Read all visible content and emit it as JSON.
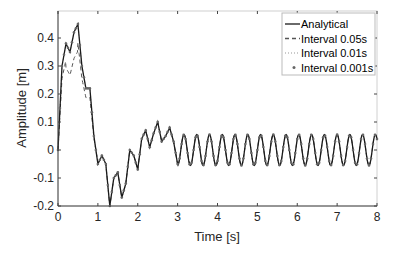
{
  "chart_data": {
    "type": "line",
    "title": "",
    "xlabel": "Time [s]",
    "ylabel": "Amplitude [m]",
    "xlim": [
      0,
      8
    ],
    "ylim": [
      -0.2,
      0.47
    ],
    "xticks": [
      "0",
      "1",
      "2",
      "3",
      "4",
      "5",
      "6",
      "7",
      "8"
    ],
    "yticks": [
      "-0.2",
      "-0.1",
      "0",
      "0.1",
      "0.2",
      "0.3",
      "0.4"
    ],
    "grid": false,
    "legend_position": "upper right",
    "legend": [
      "Analytical",
      "Interval 0.05s",
      "Interval 0.01s",
      "Interval 0.001s"
    ],
    "series": [
      {
        "name": "Analytical",
        "style": "solid",
        "color": "#1a1a1a",
        "x": [
          0,
          0.1,
          0.2,
          0.3,
          0.4,
          0.5,
          0.6,
          0.7,
          0.8,
          0.9,
          1.0,
          1.1,
          1.2,
          1.3,
          1.4,
          1.5,
          1.6,
          1.7,
          1.8,
          1.9,
          2.0,
          2.1,
          2.2,
          2.3,
          2.4,
          2.5,
          2.6,
          2.7,
          2.8,
          2.9,
          3.0
        ],
        "y": [
          0,
          0.3,
          0.38,
          0.35,
          0.42,
          0.45,
          0.3,
          0.22,
          0.22,
          0.05,
          -0.05,
          -0.02,
          -0.05,
          -0.2,
          -0.1,
          -0.08,
          -0.17,
          -0.12,
          0.0,
          -0.02,
          -0.07,
          0.04,
          0.07,
          0.01,
          0.06,
          0.1,
          0.03,
          0.05,
          0.08,
          0.03,
          -0.05
        ]
      },
      {
        "name": "Interval 0.05s",
        "style": "dashed",
        "color": "#555555"
      },
      {
        "name": "Interval 0.01s",
        "style": "dotted",
        "color": "#bbbbbb"
      },
      {
        "name": "Interval 0.001s",
        "style": "markers",
        "color": "#666666"
      }
    ],
    "steady_state": {
      "period_s": 0.32,
      "amplitude_m": 0.055,
      "offset_m": 0.0,
      "from_s": 3.0,
      "to_s": 8.0
    }
  }
}
